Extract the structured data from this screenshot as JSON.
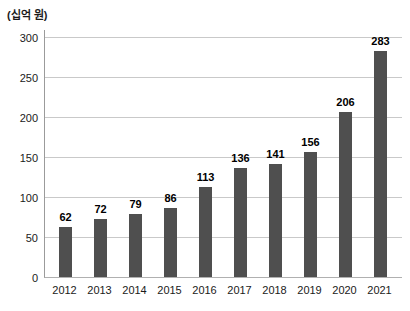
{
  "chart_data": {
    "type": "bar",
    "title": "",
    "xlabel": "",
    "ylabel": "(십억 원)",
    "categories": [
      "2012",
      "2013",
      "2014",
      "2015",
      "2016",
      "2017",
      "2018",
      "2019",
      "2020",
      "2021"
    ],
    "values": [
      62,
      72,
      79,
      86,
      113,
      136,
      141,
      156,
      206,
      283
    ],
    "ylim": [
      0,
      300
    ],
    "yticks": [
      0,
      50,
      100,
      150,
      200,
      250,
      300
    ],
    "grid": true,
    "legend": "none",
    "bar_color": "#4f4f4f",
    "gridline_color": "#c9c9c9",
    "axis_color": "#9b9b9b",
    "text_color": "#1a1a1a"
  }
}
